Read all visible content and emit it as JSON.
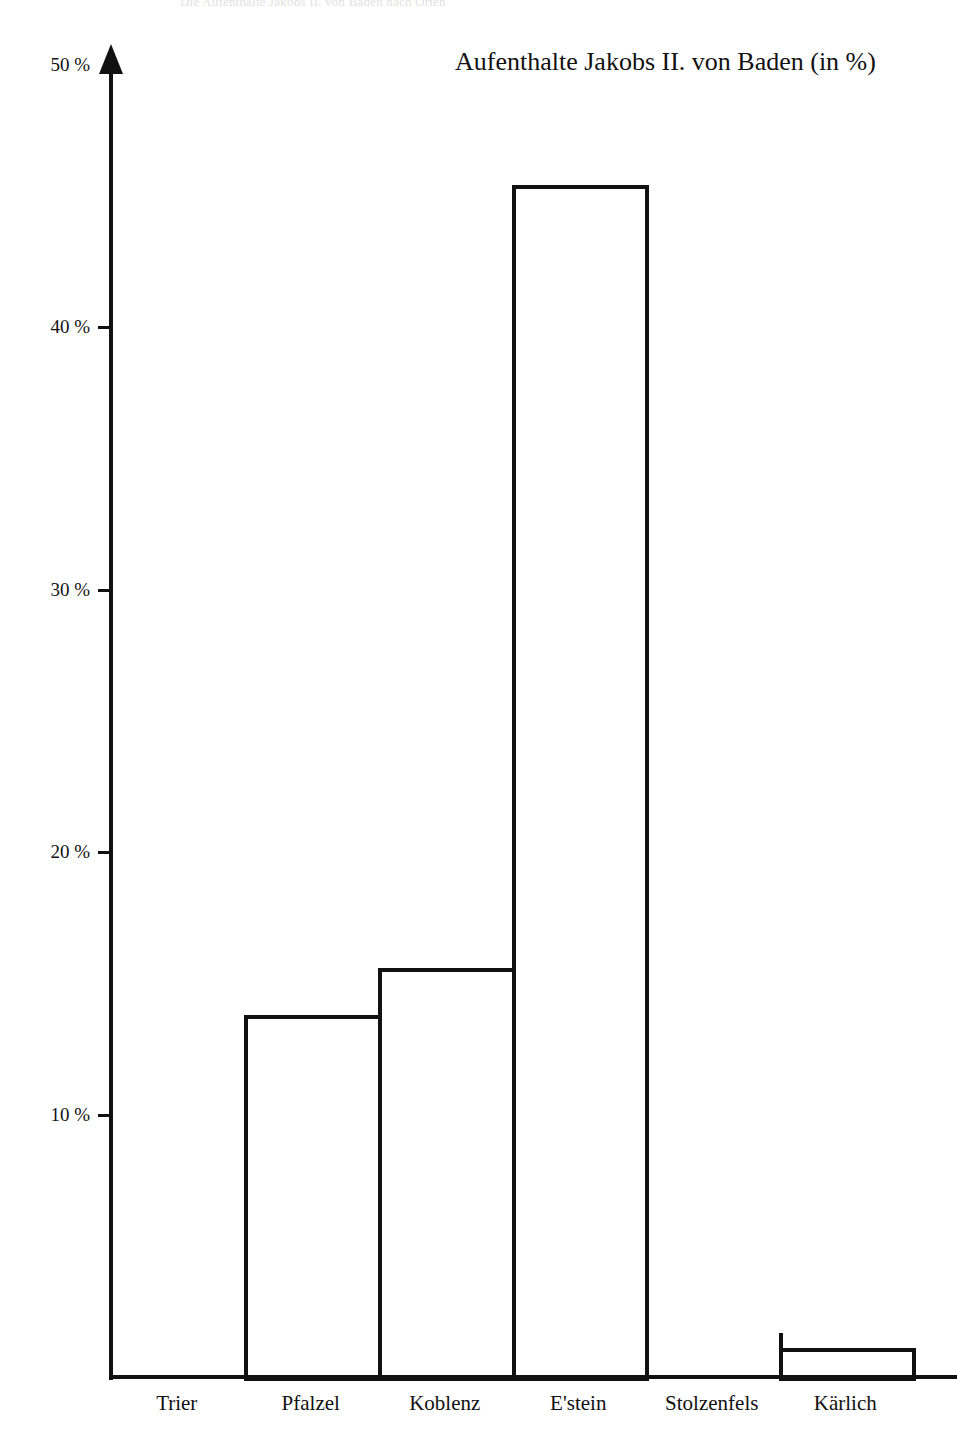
{
  "page": {
    "running_header": "Die Aufenthalte Jakobs II. von Baden nach Orten"
  },
  "chart_data": {
    "type": "bar",
    "title": "Aufenthalte Jakobs II. von Baden (in %)",
    "subtitle": "",
    "xlabel": "",
    "ylabel": "",
    "categories": [
      "Trier",
      "Pfalzel",
      "Koblenz",
      "E'stein",
      "Stolzenfels",
      "Kärlich"
    ],
    "values": [
      0,
      13.8,
      15.6,
      45.4,
      0,
      1.1
    ],
    "ylim": [
      0,
      50
    ],
    "yticks": [
      10,
      20,
      30,
      40,
      50
    ],
    "ytick_labels": [
      "10 %",
      "20 %",
      "30 %",
      "40 %",
      "50 %"
    ],
    "grid": false,
    "legend": false,
    "legend_position": "none",
    "bar_style": "outline",
    "bar_fill": "#ffffff",
    "bar_stroke": "#111111",
    "axis_color": "#111111",
    "background": "#ffffff"
  },
  "axis": {
    "y_arrow_icon": "up-arrow-icon",
    "ticks": [
      {
        "label": "50 %",
        "value": 50
      },
      {
        "label": "40 %",
        "value": 40
      },
      {
        "label": "30 %",
        "value": 30
      },
      {
        "label": "20 %",
        "value": 20
      },
      {
        "label": "10 %",
        "value": 10
      }
    ]
  },
  "bars": [
    {
      "category": "Trier",
      "value": 0,
      "label": "Trier"
    },
    {
      "category": "Pfalzel",
      "value": 13.8,
      "label": "Pfalzel"
    },
    {
      "category": "Koblenz",
      "value": 15.6,
      "label": "Koblenz"
    },
    {
      "category": "E'stein",
      "value": 45.4,
      "label": "E'stein"
    },
    {
      "category": "Stolzenfels",
      "value": 0,
      "label": "Stolzenfels"
    },
    {
      "category": "Kärlich",
      "value": 1.1,
      "label": "Kärlich"
    }
  ]
}
